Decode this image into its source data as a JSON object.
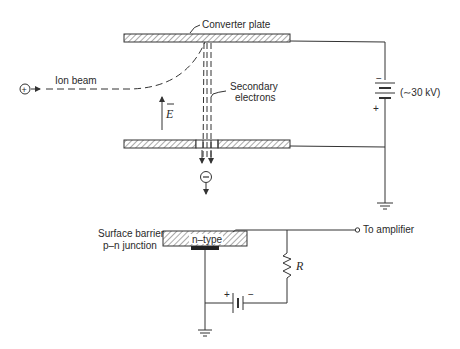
{
  "diagram": {
    "labels": {
      "converter_plate": "Converter plate",
      "ion_beam": "Ion beam",
      "secondary_electrons_line1": "Secondary",
      "secondary_electrons_line2": "electrons",
      "field": "E",
      "voltage": "(∼30 kV)",
      "battery_minus": "−",
      "battery_plus": "+",
      "ion_charge": "+",
      "electron_charge": "−",
      "detector_line1": "Surface barrier",
      "detector_line2": "p–n junction",
      "n_type": "n–type",
      "to_amplifier": "To amplifier",
      "resistor": "R",
      "bias_plus": "+",
      "bias_minus": "−"
    },
    "colors": {
      "stroke": "#333333",
      "text": "#2a2a2a",
      "background": "#ffffff"
    }
  }
}
